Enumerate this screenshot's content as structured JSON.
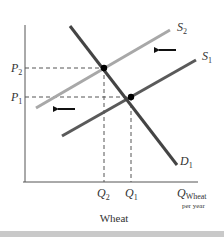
{
  "chart_data": {
    "type": "line",
    "title": "Wheat",
    "xlabel": "Q Wheat per year",
    "ylabel": "",
    "x_axis_label_main": "Q",
    "x_axis_label_sub1": "Wheat",
    "x_axis_label_sub2": "per year",
    "grid": false,
    "legend_position": "none",
    "series": [
      {
        "name": "D1",
        "label_main": "D",
        "label_sub": "1",
        "kind": "demand",
        "color": "#444444",
        "points": [
          [
            70,
            26
          ],
          [
            177,
            165
          ]
        ]
      },
      {
        "name": "S1",
        "label_main": "S",
        "label_sub": "1",
        "kind": "supply-original",
        "color": "#5a5a5a",
        "points": [
          [
            62,
            136
          ],
          [
            196,
            60
          ]
        ]
      },
      {
        "name": "S2",
        "label_main": "S",
        "label_sub": "2",
        "kind": "supply-shifted",
        "color": "#a8a8a8",
        "points": [
          [
            36,
            108
          ],
          [
            170,
            30
          ]
        ]
      }
    ],
    "equilibria": [
      {
        "name": "E2",
        "price_label": "P2",
        "quantity_label": "Q2",
        "x": 104,
        "y": 68
      },
      {
        "name": "E1",
        "price_label": "P1",
        "quantity_label": "Q1",
        "x": 131,
        "y": 97
      }
    ],
    "price_ticks": [
      {
        "main": "P",
        "sub": "2",
        "y": 68
      },
      {
        "main": "P",
        "sub": "1",
        "y": 97
      }
    ],
    "quantity_ticks": [
      {
        "main": "Q",
        "sub": "2",
        "x": 104
      },
      {
        "main": "Q",
        "sub": "1",
        "x": 131
      }
    ],
    "annotations": [
      {
        "type": "arrow",
        "direction": "left",
        "meaning": "supply shifts left",
        "x1": 176,
        "x2": 157,
        "y": 50
      },
      {
        "type": "arrow",
        "direction": "left",
        "meaning": "supply shifts left",
        "x1": 75,
        "x2": 56,
        "y": 109
      }
    ],
    "axes": {
      "origin": [
        25,
        182
      ],
      "y_top": 25,
      "x_right": 198
    }
  }
}
